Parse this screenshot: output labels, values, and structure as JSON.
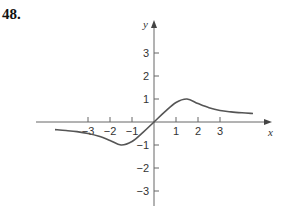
{
  "problem": {
    "number": "48."
  },
  "chart_data": {
    "type": "line",
    "title": "",
    "xlabel": "x",
    "ylabel": "y",
    "xlim": [
      -5.2,
      5.2
    ],
    "ylim": [
      -3.5,
      3.8
    ],
    "grid": false,
    "legend": null,
    "x_ticks": [
      -3,
      -2,
      -1,
      1,
      2,
      3
    ],
    "y_ticks": [
      -3,
      -2,
      -1,
      1,
      2,
      3
    ],
    "x_tick_labels": [
      "−3",
      "−2",
      "−1",
      "1",
      "2",
      "3"
    ],
    "y_tick_labels": [
      "−3",
      "−2",
      "−1",
      "1",
      "2",
      "3"
    ],
    "series": [
      {
        "name": "f(x)",
        "color": "#555555",
        "x": [
          -4.5,
          -4,
          -3.5,
          -3,
          -2.5,
          -2,
          -1.5,
          -1,
          -0.5,
          0,
          0.5,
          1,
          1.5,
          2,
          2.5,
          3,
          3.5,
          4,
          4.5
        ],
        "y": [
          -0.33,
          -0.37,
          -0.42,
          -0.5,
          -0.62,
          -0.8,
          -1.0,
          -0.85,
          -0.45,
          0,
          0.45,
          0.85,
          1.0,
          0.8,
          0.62,
          0.5,
          0.44,
          0.4,
          0.37
        ]
      }
    ],
    "annotations": []
  },
  "labels": {
    "x_axis": "x",
    "y_axis": "y",
    "x_ticks": [
      "−3",
      "−2",
      "−1",
      "1",
      "2",
      "3"
    ],
    "y_ticks": [
      "3",
      "2",
      "1",
      "−1",
      "−2",
      "−3"
    ]
  }
}
